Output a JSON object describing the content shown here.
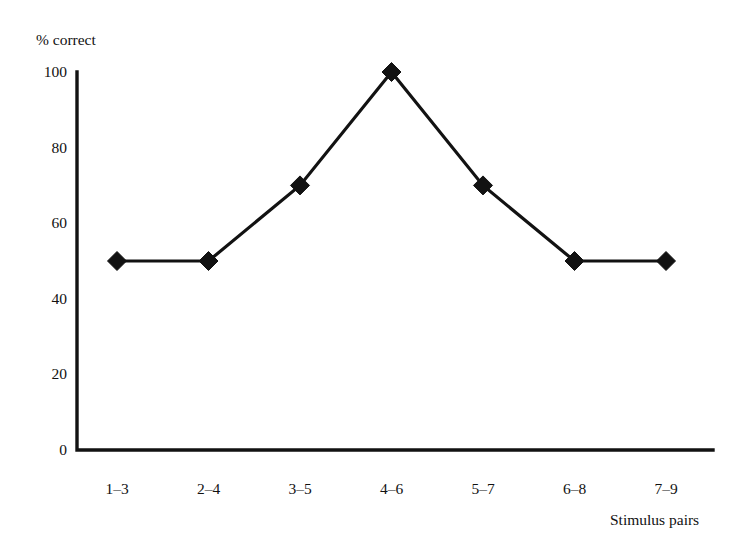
{
  "chart_data": {
    "type": "line",
    "title": "",
    "xlabel": "Stimulus pairs",
    "ylabel": "% correct",
    "categories": [
      "1–3",
      "2–4",
      "3–5",
      "4–6",
      "5–7",
      "6–8",
      "7–9"
    ],
    "values": [
      50,
      50,
      70,
      100,
      70,
      50,
      50
    ],
    "series": [
      {
        "name": "% correct",
        "values": [
          50,
          50,
          70,
          100,
          70,
          50,
          50
        ]
      }
    ],
    "ylim": [
      0,
      100
    ],
    "yticks": [
      0,
      20,
      40,
      60,
      80,
      100
    ],
    "ytick_labels": [
      "0",
      "20",
      "40",
      "60",
      "80",
      "100"
    ],
    "grid": false,
    "legend": false,
    "legend_position": "none",
    "marker": "diamond",
    "marker_color": "#121212",
    "line_color": "#121212",
    "background_color": "#ffffff",
    "annotations": []
  },
  "axes": {
    "y_title": "% correct",
    "x_title": "Stimulus pairs"
  }
}
